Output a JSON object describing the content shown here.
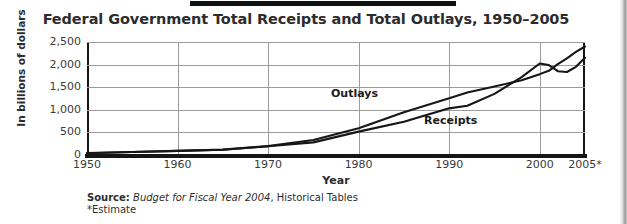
{
  "figure": {
    "title": "Federal Government Total Receipts and Total Outlays, 1950–2005",
    "source_prefix": "Source:",
    "source_italic": "Budget for Fiscal Year 2004",
    "source_suffix": ", Historical Tables",
    "estimate_note": "*Estimate"
  },
  "chart_data": {
    "type": "line",
    "title": "Federal Government Total Receipts and Total Outlays, 1950–2005",
    "xlabel": "Year",
    "ylabel": "In billions of dollars",
    "xlim": [
      1950,
      2005
    ],
    "ylim": [
      0,
      2500
    ],
    "grid": true,
    "legend_position": "inline-annotations",
    "ytick_labels": [
      "0",
      "500",
      "1,000",
      "1,500",
      "2,000",
      "2,500"
    ],
    "ytick_values": [
      0,
      500,
      1000,
      1500,
      2000,
      2500
    ],
    "xtick_labels": [
      "1950",
      "1960",
      "1970",
      "1980",
      "1990",
      "2000",
      "2005*"
    ],
    "xtick_values": [
      1950,
      1960,
      1970,
      1980,
      1990,
      2000,
      2005
    ],
    "annotations": [
      {
        "text": "Outlays",
        "x": 1982,
        "y": 1150
      },
      {
        "text": "Receipts",
        "x": 1992,
        "y": 620
      }
    ],
    "x": [
      1950,
      1955,
      1960,
      1965,
      1970,
      1975,
      1980,
      1985,
      1990,
      1992,
      1995,
      1998,
      2000,
      2001,
      2002,
      2003,
      2004,
      2005
    ],
    "series": [
      {
        "name": "Outlays",
        "values": [
          43,
          68,
          92,
          118,
          196,
          332,
          591,
          946,
          1253,
          1382,
          1516,
          1653,
          1789,
          1863,
          2011,
          2140,
          2280,
          2400
        ]
      },
      {
        "name": "Receipts",
        "values": [
          39,
          65,
          92,
          117,
          193,
          279,
          517,
          734,
          1032,
          1091,
          1352,
          1722,
          2025,
          1991,
          1853,
          1836,
          1950,
          2150
        ]
      }
    ]
  },
  "axes": {
    "yticks": [
      {
        "label": "2,500",
        "value": 2500
      },
      {
        "label": "2,000",
        "value": 2000
      },
      {
        "label": "1,500",
        "value": 1500
      },
      {
        "label": "1,000",
        "value": 1000
      },
      {
        "label": "500",
        "value": 500
      },
      {
        "label": "0",
        "value": 0
      }
    ],
    "xticks": [
      {
        "label": "1950",
        "value": 1950
      },
      {
        "label": "1960",
        "value": 1960
      },
      {
        "label": "1970",
        "value": 1970
      },
      {
        "label": "1980",
        "value": 1980
      },
      {
        "label": "1990",
        "value": 1990
      },
      {
        "label": "2000",
        "value": 2000
      },
      {
        "label": "2005*",
        "value": 2005
      }
    ]
  },
  "colors": {
    "line": "#161616",
    "grid": "#9b9b9b",
    "axis": "#151515",
    "text": "#2c2c2c"
  }
}
